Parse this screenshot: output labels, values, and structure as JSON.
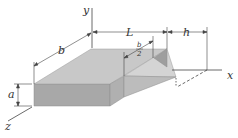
{
  "diagram": {
    "axes": {
      "x_label": "x",
      "y_label": "y",
      "z_label": "z"
    },
    "dimensions": {
      "width_label": "b",
      "length_label": "L",
      "offset_label": "h",
      "height_label": "a",
      "half_width_numerator": "b",
      "half_width_denominator": "2"
    },
    "colors": {
      "top_face": "#c8c8c8",
      "front_face": "#a8a8a8",
      "side_face": "#b4b4b4",
      "wedge_top": "#d2d2d2",
      "wedge_side": "#9e9e9e",
      "line": "#333333"
    }
  }
}
